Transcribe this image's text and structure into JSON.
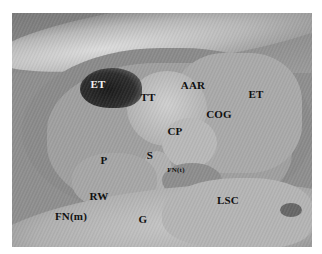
{
  "figure": {
    "type": "labeled surgical/anatomical photograph (middle ear, grayscale)",
    "labels": [
      {
        "id": "et-left",
        "text": "ET",
        "x": 98,
        "y": 84,
        "light": true
      },
      {
        "id": "tt",
        "text": "TT",
        "x": 148,
        "y": 97
      },
      {
        "id": "aar",
        "text": "AAR",
        "x": 193,
        "y": 85
      },
      {
        "id": "et-right",
        "text": "ET",
        "x": 256,
        "y": 94
      },
      {
        "id": "cog",
        "text": "COG",
        "x": 219,
        "y": 114
      },
      {
        "id": "cp",
        "text": "CP",
        "x": 175,
        "y": 131
      },
      {
        "id": "s",
        "text": "S",
        "x": 150,
        "y": 155
      },
      {
        "id": "p",
        "text": "P",
        "x": 104,
        "y": 160
      },
      {
        "id": "fn-t",
        "text": "FN(t)",
        "x": 176,
        "y": 170,
        "small": true
      },
      {
        "id": "rw",
        "text": "RW",
        "x": 99,
        "y": 196
      },
      {
        "id": "lsc",
        "text": "LSC",
        "x": 228,
        "y": 200
      },
      {
        "id": "fn-m",
        "text": "FN(m)",
        "x": 71,
        "y": 216
      },
      {
        "id": "g",
        "text": "G",
        "x": 143,
        "y": 219
      }
    ]
  }
}
